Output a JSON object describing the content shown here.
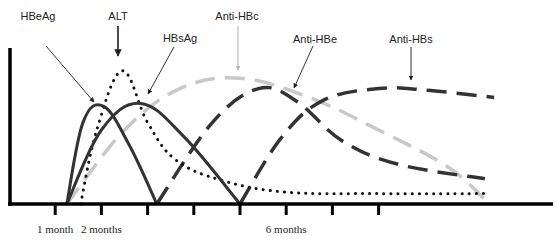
{
  "chart_data": {
    "type": "line",
    "title": "",
    "xlabel": "",
    "ylabel": "",
    "x_unit": "months",
    "xlim": [
      0,
      11.5
    ],
    "ylim": [
      0,
      1
    ],
    "grid": false,
    "legend": "none (curves labelled with arrows)",
    "x_ticks": [
      1,
      2,
      3,
      4,
      5,
      6,
      7,
      8
    ],
    "x_tick_labels": [
      {
        "x": 1,
        "label": "1 month"
      },
      {
        "x": 2,
        "label": "2 months"
      },
      {
        "x": 6,
        "label": "6 months"
      }
    ],
    "series": [
      {
        "name": "HBeAg",
        "style": "solid",
        "color": "#333333",
        "points": [
          [
            1.25,
            0
          ],
          [
            1.6,
            0.55
          ],
          [
            2.05,
            0.66
          ],
          [
            2.6,
            0.4
          ],
          [
            3.2,
            0
          ]
        ]
      },
      {
        "name": "HBsAg",
        "style": "solid",
        "color": "#333333",
        "points": [
          [
            1.25,
            0
          ],
          [
            2.0,
            0.5
          ],
          [
            2.85,
            0.68
          ],
          [
            3.8,
            0.45
          ],
          [
            5.0,
            0
          ]
        ]
      },
      {
        "name": "ALT",
        "style": "dotted",
        "color": "#111111",
        "points": [
          [
            1.55,
            0
          ],
          [
            1.9,
            0.5
          ],
          [
            2.45,
            0.9
          ],
          [
            3.0,
            0.55
          ],
          [
            3.6,
            0.3
          ],
          [
            4.6,
            0.16
          ],
          [
            6.0,
            0.08
          ],
          [
            8.0,
            0.07
          ],
          [
            10.4,
            0.07
          ]
        ]
      },
      {
        "name": "Anti-HBc",
        "style": "dashed",
        "color": "#c8c8c8",
        "points": [
          [
            1.25,
            0
          ],
          [
            2.5,
            0.5
          ],
          [
            3.7,
            0.78
          ],
          [
            5.0,
            0.85
          ],
          [
            6.5,
            0.72
          ],
          [
            8.0,
            0.5
          ],
          [
            9.5,
            0.25
          ],
          [
            10.4,
            0
          ]
        ]
      },
      {
        "name": "Anti-HBe",
        "style": "dashed",
        "color": "#333333",
        "points": [
          [
            3.2,
            0
          ],
          [
            4.4,
            0.55
          ],
          [
            5.4,
            0.78
          ],
          [
            6.2,
            0.7
          ],
          [
            7.2,
            0.43
          ],
          [
            8.4,
            0.27
          ],
          [
            10.3,
            0.17
          ]
        ]
      },
      {
        "name": "Anti-HBs",
        "style": "dashed",
        "color": "#333333",
        "points": [
          [
            5.0,
            0
          ],
          [
            5.9,
            0.45
          ],
          [
            6.8,
            0.7
          ],
          [
            8.0,
            0.78
          ],
          [
            9.0,
            0.77
          ],
          [
            10.5,
            0.72
          ]
        ]
      }
    ],
    "annotations": [
      {
        "text": "HBeAg",
        "points_to": "HBeAg",
        "arrow_color": "#333333"
      },
      {
        "text": "ALT",
        "points_to": "ALT",
        "arrow_color": "#111111"
      },
      {
        "text": "HBsAg",
        "points_to": "HBsAg",
        "arrow_color": "#333333"
      },
      {
        "text": "Anti-HBc",
        "points_to": "Anti-HBc",
        "arrow_color": "#b0b0b0"
      },
      {
        "text": "Anti-HBe",
        "points_to": "Anti-HBe",
        "arrow_color": "#333333"
      },
      {
        "text": "Anti-HBs",
        "points_to": "Anti-HBs",
        "arrow_color": "#333333"
      }
    ]
  }
}
